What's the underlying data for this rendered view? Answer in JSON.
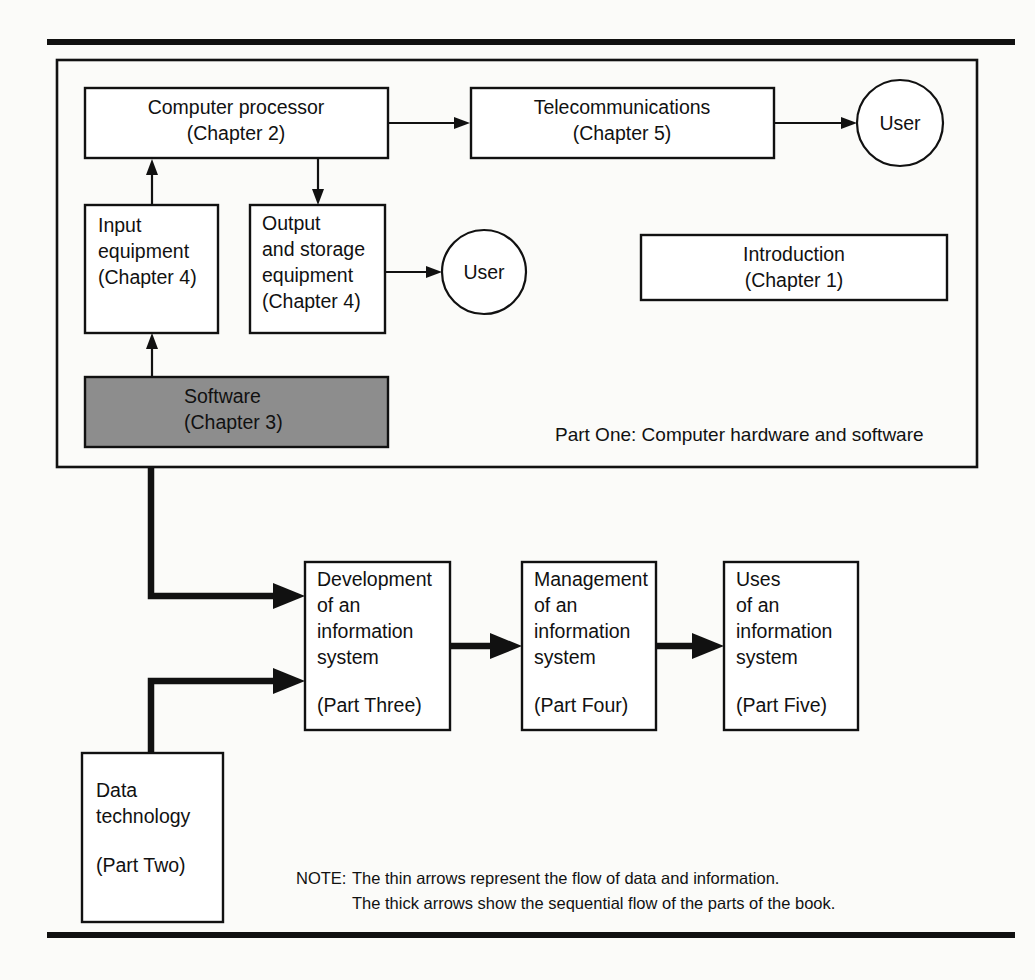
{
  "figure": {
    "shaded_color": "#8d8d8d",
    "line_color": "#111111",
    "background_color": "#fbfbf9"
  },
  "part_one": {
    "caption": "Part One:  Computer hardware and software",
    "boxes": {
      "computer_processor": {
        "line1": "Computer processor",
        "line2": "(Chapter 2)"
      },
      "telecommunications": {
        "line1": "Telecommunications",
        "line2": "(Chapter 5)"
      },
      "input_equipment": {
        "line1": "Input",
        "line2": "equipment",
        "line3": "(Chapter 4)"
      },
      "output_storage_equipment": {
        "line1": "Output",
        "line2": "and storage",
        "line3": "equipment",
        "line4": "(Chapter 4)"
      },
      "software": {
        "line1": "Software",
        "line2": "(Chapter 3)",
        "shaded": "true"
      },
      "introduction": {
        "line1": "Introduction",
        "line2": "(Chapter 1)"
      }
    },
    "users": {
      "user_top": "User",
      "user_middle": "User"
    }
  },
  "parts_flow": {
    "development": {
      "line1": "Development",
      "line2": "of an",
      "line3": "information",
      "line4": "system",
      "line5": "(Part Three)"
    },
    "management": {
      "line1": "Management",
      "line2": "of an",
      "line3": "information",
      "line4": "system",
      "line5": "(Part Four)"
    },
    "uses": {
      "line1": "Uses",
      "line2": "of an",
      "line3": "information",
      "line4": "system",
      "line5": "(Part Five)"
    },
    "data_technology": {
      "line1": "Data",
      "line2": "technology",
      "line3": "(Part Two)"
    }
  },
  "note": {
    "label": "NOTE:",
    "line1": "The thin arrows represent the flow of data and information.",
    "line2": "The thick arrows show the sequential flow of the parts of the book."
  }
}
